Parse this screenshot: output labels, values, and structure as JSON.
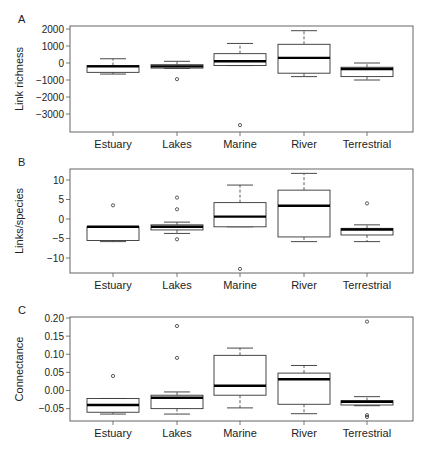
{
  "chart_data": [
    {
      "panel": "A",
      "type": "box",
      "title": "",
      "xlabel": "",
      "ylabel": "Link richness",
      "categories": [
        "Estuary",
        "Lakes",
        "Marine",
        "River",
        "Terrestrial"
      ],
      "yticks": [
        2000,
        1000,
        0,
        -1000,
        -2000,
        -3000
      ],
      "ytick_labels": [
        "2000",
        "1000",
        "0",
        "−1000",
        "−2000",
        "−3000"
      ],
      "ylim": [
        -3800,
        2250
      ],
      "grid": false,
      "boxes": [
        {
          "category": "Estuary",
          "whisker_low": -650,
          "q1": -550,
          "median": -200,
          "q3": -150,
          "whisker_high": 250,
          "outliers": []
        },
        {
          "category": "Lakes",
          "whisker_low": -320,
          "q1": -300,
          "median": -200,
          "q3": -100,
          "whisker_high": 100,
          "outliers": [
            -950
          ]
        },
        {
          "category": "Marine",
          "whisker_low": -150,
          "q1": -150,
          "median": 100,
          "q3": 550,
          "whisker_high": 1150,
          "outliers": [
            -3650
          ]
        },
        {
          "category": "River",
          "whisker_low": -800,
          "q1": -600,
          "median": 300,
          "q3": 1100,
          "whisker_high": 1900,
          "outliers": []
        },
        {
          "category": "Terrestrial",
          "whisker_low": -1000,
          "q1": -800,
          "median": -350,
          "q3": -250,
          "whisker_high": 0,
          "outliers": []
        }
      ]
    },
    {
      "panel": "B",
      "type": "box",
      "title": "",
      "xlabel": "",
      "ylabel": "Links/species",
      "categories": [
        "Estuary",
        "Lakes",
        "Marine",
        "River",
        "Terrestrial"
      ],
      "yticks": [
        10,
        5,
        0,
        -5,
        -10
      ],
      "ytick_labels": [
        "10",
        "5",
        "0",
        "−5",
        "−10"
      ],
      "ylim": [
        -13.8,
        12.8
      ],
      "grid": false,
      "boxes": [
        {
          "category": "Estuary",
          "whisker_low": -5.8,
          "q1": -5.5,
          "median": -2,
          "q3": -2,
          "whisker_high": -2,
          "outliers": [
            3.5
          ]
        },
        {
          "category": "Lakes",
          "whisker_low": -3.7,
          "q1": -2.8,
          "median": -2,
          "q3": -1.5,
          "whisker_high": -0.8,
          "outliers": [
            5.5,
            2.5,
            -5.2
          ]
        },
        {
          "category": "Marine",
          "whisker_low": -2,
          "q1": -2,
          "median": 0.6,
          "q3": 4.2,
          "whisker_high": 8.7,
          "outliers": [
            -12.8
          ]
        },
        {
          "category": "River",
          "whisker_low": -5.8,
          "q1": -4.6,
          "median": 3.4,
          "q3": 7.4,
          "whisker_high": 11.7,
          "outliers": []
        },
        {
          "category": "Terrestrial",
          "whisker_low": -5.8,
          "q1": -4.1,
          "median": -2.7,
          "q3": -2.4,
          "whisker_high": -1.5,
          "outliers": [
            4.0
          ]
        }
      ]
    },
    {
      "panel": "C",
      "type": "box",
      "title": "",
      "xlabel": "",
      "ylabel": "Connectance",
      "categories": [
        "Estuary",
        "Lakes",
        "Marine",
        "River",
        "Terrestrial"
      ],
      "yticks": [
        0.2,
        0.15,
        0.1,
        0.05,
        0.0,
        -0.05
      ],
      "ytick_labels": [
        "0.20",
        "0.15",
        "0.10",
        "0.05",
        "0.00",
        "−0.05"
      ],
      "ylim": [
        -0.084,
        0.203
      ],
      "grid": false,
      "boxes": [
        {
          "category": "Estuary",
          "whisker_low": -0.065,
          "q1": -0.06,
          "median": -0.04,
          "q3": -0.022,
          "whisker_high": -0.022,
          "outliers": [
            0.04
          ]
        },
        {
          "category": "Lakes",
          "whisker_low": -0.065,
          "q1": -0.05,
          "median": -0.02,
          "q3": -0.013,
          "whisker_high": -0.004,
          "outliers": [
            0.178,
            0.09
          ]
        },
        {
          "category": "Marine",
          "whisker_low": -0.048,
          "q1": -0.013,
          "median": 0.013,
          "q3": 0.097,
          "whisker_high": 0.117,
          "outliers": []
        },
        {
          "category": "River",
          "whisker_low": -0.064,
          "q1": -0.038,
          "median": 0.031,
          "q3": 0.048,
          "whisker_high": 0.069,
          "outliers": []
        },
        {
          "category": "Terrestrial",
          "whisker_low": -0.042,
          "q1": -0.04,
          "median": -0.031,
          "q3": -0.028,
          "whisker_high": -0.017,
          "outliers": [
            0.19,
            -0.068,
            -0.073
          ]
        }
      ]
    }
  ],
  "panels": [
    {
      "label": "A",
      "top": 26,
      "bottom": 132,
      "ref_val_a": 2000,
      "ref_px_a": 29,
      "ref_val_b": 0,
      "ref_px_b": 63
    },
    {
      "label": "B",
      "top": 169,
      "bottom": 273,
      "ref_val_a": 10,
      "ref_px_a": 180,
      "ref_val_b": 0,
      "ref_px_b": 219
    },
    {
      "label": "C",
      "top": 317,
      "bottom": 421,
      "ref_val_a": 0.2,
      "ref_px_a": 318,
      "ref_val_b": 0.0,
      "ref_px_b": 390.5
    }
  ],
  "layout": {
    "plot_left": 70,
    "plot_right": 413,
    "category_x": [
      113,
      177,
      240,
      304,
      367
    ],
    "box_half_width": 26
  },
  "colors": {
    "axis": "#555555",
    "box_stroke": "#333333",
    "median": "#000000",
    "text": "#222222",
    "background": "#ffffff"
  }
}
